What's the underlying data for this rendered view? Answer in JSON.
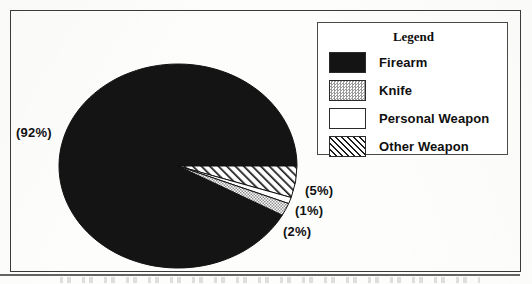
{
  "chart_data": {
    "type": "pie",
    "title": "",
    "subtitle": "",
    "xlabel": "",
    "ylabel": "",
    "grid": false,
    "legend_position": "top-right",
    "legend_title": "Legend",
    "categories": [
      "Firearm",
      "Knife",
      "Personal Weapon",
      "Other Weapon"
    ],
    "values": [
      92,
      5,
      1,
      2
    ],
    "value_unit": "%",
    "data_labels": [
      "(92%)",
      "(5%)",
      "(1%)",
      "(2%)"
    ],
    "slices": [
      {
        "label": "Firearm",
        "value": 92,
        "data_label": "(92%)",
        "fill": "solid-black",
        "color": "#141414"
      },
      {
        "label": "Other Weapon",
        "value": 5,
        "data_label": "(5%)",
        "fill": "diagonal-hatch",
        "color": "#1d1d1d"
      },
      {
        "label": "Personal Weapon",
        "value": 1,
        "data_label": "(1%)",
        "fill": "white",
        "color": "#ffffff"
      },
      {
        "label": "Knife",
        "value": 2,
        "data_label": "(2%)",
        "fill": "stipple-gray",
        "color": "#9a9a9a"
      }
    ]
  },
  "frame": {
    "border_color": "#3a3a3a",
    "background": "#fdfdfc"
  },
  "pie": {
    "outline_color": "#111111",
    "center_x": 178,
    "center_y": 166,
    "radius_x": 119,
    "radius_y": 102,
    "start_angle_deg": 0
  },
  "labels": {
    "firearm_pct": "(92%)",
    "other_weapon_pct": "(5%)",
    "personal_weapon_pct": "(1%)",
    "knife_pct": "(2%)"
  },
  "legend": {
    "title": "Legend",
    "items": [
      {
        "label": "Firearm",
        "swatch": "solid-black-swatch"
      },
      {
        "label": "Knife",
        "swatch": "stipple-gray-swatch"
      },
      {
        "label": "Personal Weapon",
        "swatch": "white-swatch"
      },
      {
        "label": "Other Weapon",
        "swatch": "diagonal-hatch-swatch"
      }
    ]
  }
}
